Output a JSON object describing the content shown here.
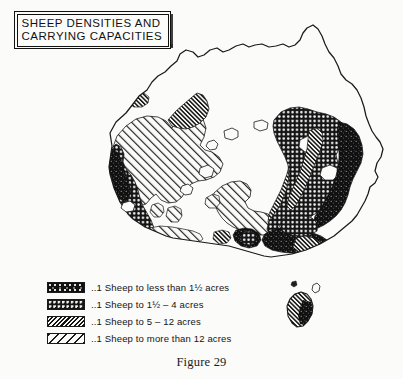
{
  "figure": {
    "caption": "Figure 29",
    "title_lines": [
      "SHEEP DENSITIES AND",
      "CARRYING CAPACITIES"
    ],
    "style": "scanned monochrome thematic map"
  },
  "legend": {
    "items": [
      {
        "pattern": "dense-black-stipple",
        "swatch_class": "sw-dense-black",
        "label": "..1 Sheep to less than 1½  acres",
        "density_rank": 1
      },
      {
        "pattern": "white-dots-on-black",
        "swatch_class": "sw-dotted",
        "label": "..1 Sheep to 1½ – 4 acres",
        "density_rank": 2
      },
      {
        "pattern": "dense-diagonal-hatch",
        "swatch_class": "sw-hatch-dense",
        "label": "..1 Sheep to 5 – 12 acres",
        "density_rank": 3
      },
      {
        "pattern": "sparse-diagonal-hatch",
        "swatch_class": "sw-hatch-sparse",
        "label": "..1 Sheep to more than 12 acres",
        "density_rank": 4
      }
    ]
  },
  "colors": {
    "ink": "#121212",
    "paper": "#fbfbfa",
    "coastline": "#1a1a1a"
  }
}
